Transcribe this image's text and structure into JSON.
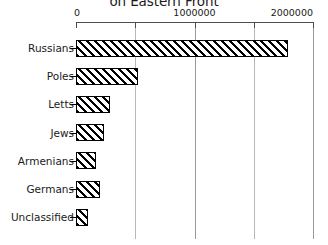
{
  "chart_data": {
    "type": "bar",
    "orientation": "horizontal",
    "title": "on Eastern Front",
    "xlabel": "",
    "ylabel": "",
    "categories": [
      "Russians",
      "Poles",
      "Letts",
      "Jews",
      "Armenians",
      "Germans",
      "Unclassified"
    ],
    "values": [
      1790000,
      525000,
      290000,
      240000,
      170000,
      205000,
      100000
    ],
    "xlim": [
      0,
      2000000
    ],
    "xticks": [
      0,
      500000,
      1000000,
      1500000,
      2000000
    ],
    "xticklabels": [
      "0",
      "",
      "1000000",
      "",
      "2000000"
    ],
    "grid": true,
    "grid_axis": "x",
    "legend": false,
    "bar_fill": "#ffffff",
    "bar_edge": "#000000",
    "bar_hatch": "diagonal-forward-slash",
    "axis_color": "#4d4d4d",
    "grid_color": "#b8b8b8",
    "text_color": "#1a1a1a",
    "background": "#ffffff",
    "axis_position": "top"
  },
  "axis": {
    "tick_labels": [
      {
        "text": "0",
        "value": 0
      },
      {
        "text": "1000000",
        "value": 1000000
      },
      {
        "text": "2000000",
        "value": 2000000
      }
    ]
  }
}
